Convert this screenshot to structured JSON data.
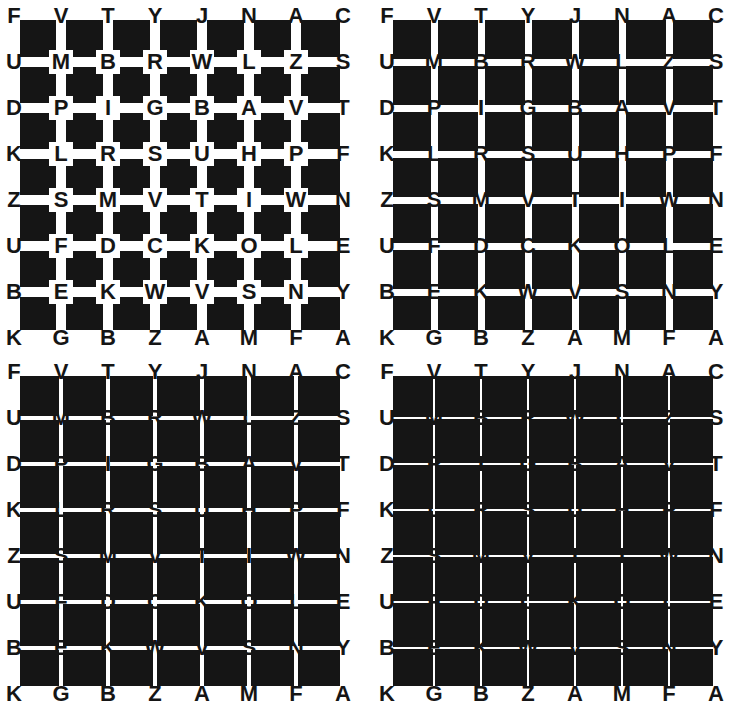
{
  "figure": {
    "grid_rows": [
      [
        "F",
        "V",
        "T",
        "Y",
        "J",
        "N",
        "A",
        "C"
      ],
      [
        "U",
        "M",
        "B",
        "R",
        "W",
        "L",
        "Z",
        "S"
      ],
      [
        "D",
        "P",
        "I",
        "G",
        "B",
        "A",
        "V",
        "T"
      ],
      [
        "K",
        "L",
        "R",
        "S",
        "U",
        "H",
        "P",
        "F"
      ],
      [
        "Z",
        "S",
        "M",
        "V",
        "T",
        "I",
        "W",
        "N"
      ],
      [
        "U",
        "F",
        "D",
        "C",
        "K",
        "O",
        "L",
        "E"
      ],
      [
        "B",
        "E",
        "K",
        "W",
        "V",
        "S",
        "N",
        "Y"
      ],
      [
        "K",
        "G",
        "B",
        "Z",
        "A",
        "M",
        "F",
        "A"
      ]
    ],
    "panels": [
      {
        "id": "top-left",
        "x": 0,
        "y": 0,
        "line_width": 10,
        "halo": 24
      },
      {
        "id": "top-right",
        "x": 373,
        "y": 0,
        "line_width": 7,
        "halo": 0
      },
      {
        "id": "bottom-left",
        "x": 0,
        "y": 356,
        "line_width": 4,
        "halo": 0
      },
      {
        "id": "bottom-right",
        "x": 373,
        "y": 356,
        "line_width": 2,
        "halo": 0
      }
    ],
    "colors": {
      "board": "#151515",
      "lines": "#ffffff",
      "letters": "#151515"
    }
  }
}
